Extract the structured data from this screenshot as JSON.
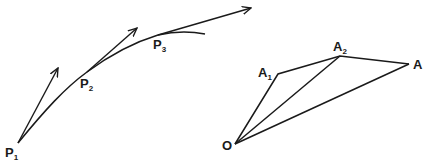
{
  "left_figure": {
    "description": "Curve with tangent vectors at successive points",
    "points": [
      {
        "id": "P1",
        "base": "P",
        "sub": "1"
      },
      {
        "id": "P2",
        "base": "P",
        "sub": "2"
      },
      {
        "id": "P3",
        "base": "P",
        "sub": "3"
      }
    ]
  },
  "right_figure": {
    "description": "Vector polygon from origin O",
    "points": [
      {
        "id": "O",
        "base": "O",
        "sub": ""
      },
      {
        "id": "A1",
        "base": "A",
        "sub": "1"
      },
      {
        "id": "A2",
        "base": "A",
        "sub": "2"
      },
      {
        "id": "A",
        "base": "A",
        "sub": ""
      }
    ]
  },
  "colors": {
    "stroke": "#1a1a1a",
    "background": "#ffffff"
  }
}
